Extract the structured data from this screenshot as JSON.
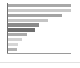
{
  "chart_data": {
    "type": "bar",
    "orientation": "horizontal",
    "title": "",
    "subtitle": "",
    "xlabel": "",
    "ylabel": "",
    "grid": false,
    "legend": false,
    "legend_position": "none",
    "xlim": [
      0,
      100
    ],
    "categories": [
      "Category 1",
      "Category 2",
      "Category 3",
      "Category 4",
      "Category 5",
      "Category 6",
      "Category 7",
      "Category 8",
      "Category 9",
      "Category 10"
    ],
    "values": [
      88,
      88,
      75,
      56,
      43,
      38,
      26,
      19,
      14,
      13
    ],
    "tick_labels": [],
    "annotations": [],
    "bar_colors": [
      "#a8a8a8",
      "#c9c9c9",
      "#a3a3a3",
      "#c4c4c4",
      "#8a8a8a",
      "#6e6e6e",
      "#ababab",
      "#d2d2d2",
      "#d6d6d6",
      "#b4b4b4"
    ]
  },
  "axes": {
    "y_axis_color": "#707070",
    "x_axis_color": "#9a9a9a"
  },
  "chrome": {
    "background_color": "#ffffff",
    "separator_color": "#e2e2e2",
    "caption": ""
  },
  "labels": {
    "chart_alt": "Horizontal bar chart thumbnail with ten grey bars of decreasing length"
  }
}
